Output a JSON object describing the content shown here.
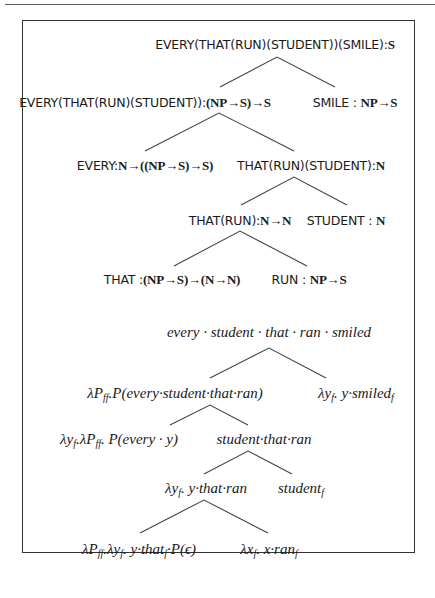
{
  "figure": {
    "upper_tree": {
      "root": "EVERY(THAT(RUN)(STUDENT))(SMILE):S",
      "l1_left": "EVERY(THAT(RUN)(STUDENT)):(NP→S)→S",
      "l1_right": "SMILE : NP→S",
      "l2_left": "EVERY:N→((NP→S)→S)",
      "l2_right": "THAT(RUN)(STUDENT):N",
      "l3_left": "THAT(RUN):N→N",
      "l3_right": "STUDENT : N",
      "l4_left": "THAT :(NP→S)→(N→N)",
      "l4_right": "RUN : NP→S"
    },
    "lower_tree": {
      "root": "every · student · that · ran · smiled",
      "l1_left": "λP_ff.P(every·student·that·ran)",
      "l1_right": "λy_f. y·smiled_f",
      "l2_left": "λy_f.λP_ff. P(every · y)",
      "l2_right": "student·that·ran",
      "l3_left": "λy_f. y·that·ran",
      "l3_right": "student_f",
      "l4_left": "λP_ff.λy_f. y·that_f·P(ϵ)",
      "l4_right": "λx_f. x·ran_f"
    }
  },
  "text": {
    "u_root": [
      "EVERY(THAT(RUN)(STUDENT))(SMILE):",
      "S"
    ],
    "u_l1_left": [
      "EVERY(THAT(RUN)(STUDENT)):",
      "(NP→S)→S"
    ],
    "u_l1_right": [
      "SMILE : ",
      "NP→S"
    ],
    "u_l2_left": [
      "EVERY:",
      "N→((NP→S)→S)"
    ],
    "u_l2_right": [
      "THAT(RUN)(STUDENT):",
      "N"
    ],
    "u_l3_left": [
      "THAT(RUN):",
      "N→N"
    ],
    "u_l3_right": [
      "STUDENT : ",
      "N"
    ],
    "u_l4_left": [
      "THAT :",
      "(NP→S)→(N→N)"
    ],
    "u_l4_right": [
      "RUN : ",
      "NP→S"
    ],
    "w_root": "every · student · that · ran · smiled",
    "w_l1_left": [
      "λP",
      "ff",
      ".P(every·student·that·ran)"
    ],
    "w_l1_right": [
      "λy",
      "f",
      ". y·smiled",
      "f"
    ],
    "w_l2_left": [
      "λy",
      "f",
      ".λP",
      "ff",
      ". P(every · y)"
    ],
    "w_l2_right": "student·that·ran",
    "w_l3_left": [
      "λy",
      "f",
      ". y·that·ran"
    ],
    "w_l3_right": [
      "student",
      "f"
    ],
    "w_l4_left": [
      "λP",
      "ff",
      ".λy",
      "f",
      ". y·that",
      "f",
      "·P(ϵ)"
    ],
    "w_l4_right": [
      "λx",
      "f",
      ". x·ran",
      "f"
    ]
  },
  "colors": {
    "ink": "#1a1a1a",
    "frame": "#333333",
    "branch": "#444444"
  }
}
